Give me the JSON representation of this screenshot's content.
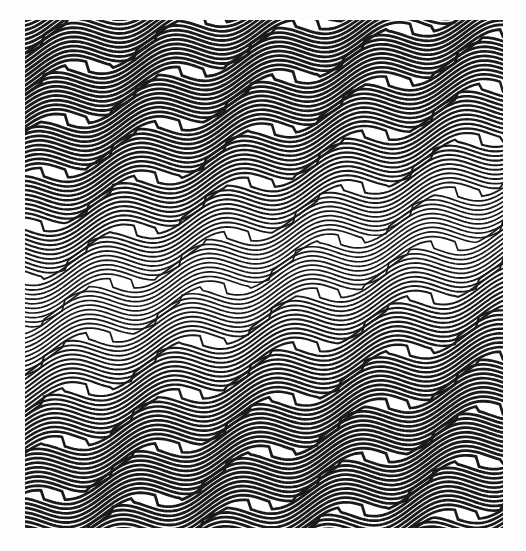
{
  "artwork": {
    "title": "Op Art Wave Interference Pattern",
    "medium": "monochrome line engraving",
    "canvas": {
      "width": 526,
      "height": 551,
      "background_color": "#fdfdfd"
    },
    "plate": {
      "x": 25,
      "y": 20,
      "width": 478,
      "height": 508,
      "paper_color": "#ffffff"
    },
    "ink_color": "#1a1a1a",
    "paper_color": "#ffffff"
  },
  "chart_data": {
    "type": "line",
    "subtitle": "Sinusoidal horizontal striping with diagonal band phase shear",
    "xlabel": "",
    "ylabel": "",
    "grid": false,
    "legend": null,
    "xlim": [
      25,
      503
    ],
    "ylim": [
      20,
      528
    ],
    "wave": {
      "stripe_pitch_px": 4.6,
      "stripe_count": 112,
      "wavelength_px": 120,
      "amplitude_px": 10.5,
      "phase_offset_deg": 18,
      "line_weight_min_px": 0.9,
      "line_weight_max_px": 2.9
    },
    "diagonal_bands": {
      "angle_deg": 11.3,
      "slope": -0.2,
      "count": 12,
      "spacing_px": 46,
      "phase_jump_deg": 52
    },
    "density_profile": {
      "comment": "Relative ink weight by vertical position of band, 0 = light/grey, 1 = dark/heavy",
      "y_positions": [
        20,
        60,
        105,
        150,
        195,
        240,
        265,
        290,
        330,
        375,
        420,
        465,
        505,
        528
      ],
      "weights": [
        0.95,
        1.0,
        0.92,
        0.8,
        0.62,
        0.4,
        0.3,
        0.35,
        0.55,
        0.75,
        0.9,
        1.0,
        0.95,
        0.9
      ]
    },
    "series": [
      {
        "name": "stripe-envelope-upper",
        "values": [
          0.95,
          1.0,
          0.92,
          0.8,
          0.62,
          0.4,
          0.3,
          0.35,
          0.55,
          0.75,
          0.9,
          1.0,
          0.95,
          0.9
        ]
      }
    ]
  }
}
